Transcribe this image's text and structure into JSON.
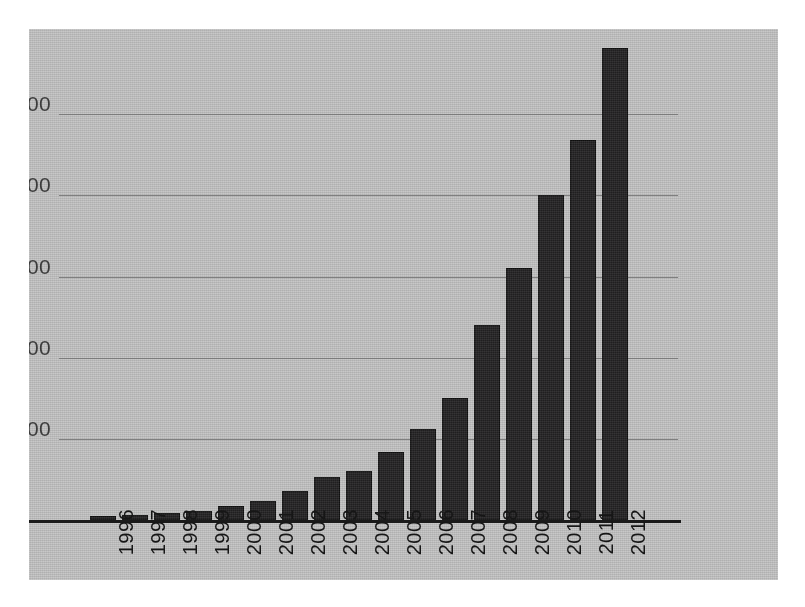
{
  "chart_data": {
    "type": "bar",
    "title": "",
    "xlabel": "",
    "ylabel": "",
    "categories": [
      "1996",
      "1997",
      "1998",
      "1999",
      "2000",
      "2001",
      "2002",
      "2003",
      "2004",
      "2005",
      "2006",
      "2007",
      "2008",
      "2009",
      "2010",
      "2011",
      "2012"
    ],
    "values": [
      2400,
      3000,
      4200,
      5400,
      8400,
      12000,
      18000,
      26500,
      30000,
      42000,
      56000,
      75000,
      120000,
      155000,
      200000,
      234000,
      291000
    ],
    "series": [
      {
        "name": "",
        "values": [
          2400,
          3000,
          4200,
          5400,
          8400,
          12000,
          18000,
          26500,
          30000,
          42000,
          56000,
          75000,
          120000,
          155000,
          200000,
          234000,
          291000
        ]
      }
    ],
    "ylim": [
      0,
      300000
    ],
    "ytick_values": [
      50000,
      100000,
      150000,
      200000,
      250000
    ],
    "ytick_labels": [
      "50,000",
      "100,000",
      "150,000",
      "200,000",
      "250,000"
    ],
    "grid": true,
    "grid_axis": "y",
    "legend": false,
    "legend_position": "none",
    "bar_color": "#201f20",
    "plot_background": "#b9b9b9",
    "figure_background": "#ffffff",
    "gridline_color": "#6e6e6e",
    "axis_color": "#1a1a1a",
    "tick_label_color": "#161616",
    "xtick_rotation": -90
  }
}
